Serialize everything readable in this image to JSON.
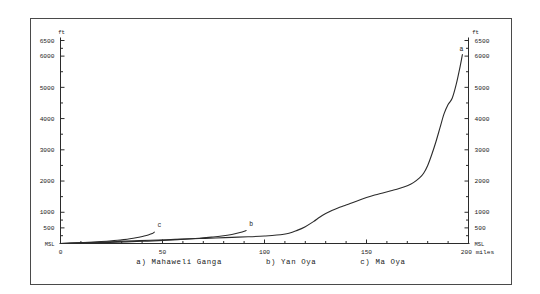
{
  "figure": {
    "y_unit_label": "ft",
    "x_unit_label": "miles",
    "baseline_label": "MSL"
  },
  "legend": {
    "entries": [
      {
        "key": "a",
        "label": "a) Mahaweli Ganga"
      },
      {
        "key": "b",
        "label": "b) Yan Oya"
      },
      {
        "key": "c",
        "label": "c) Ma Oya"
      }
    ]
  },
  "curve_labels": {
    "a": "a",
    "b": "b",
    "c": "c"
  },
  "axis_text": {
    "y_left": [
      "6500",
      "6000",
      "5000",
      "4000",
      "3000",
      "2000",
      "1000",
      "500",
      "MSL"
    ],
    "y_right": [
      "6500",
      "6000",
      "5000",
      "4000",
      "3000",
      "2000",
      "1000",
      "500",
      "MSL"
    ],
    "x": [
      "0",
      "50",
      "100",
      "150",
      "200"
    ],
    "x_end_unit": "200 miles",
    "y_top_unit_left": "ft",
    "y_top_unit_right": "ft"
  },
  "chart_data": {
    "type": "line",
    "title": "",
    "subtitle": "",
    "xlabel": "miles",
    "ylabel": "ft",
    "xlim": [
      0,
      200
    ],
    "ylim": [
      0,
      6500
    ],
    "grid": false,
    "legend_position": "below-plot",
    "annotations": [
      {
        "text": "a",
        "x": 197,
        "y": 6050
      },
      {
        "text": "b",
        "x": 92,
        "y": 430
      },
      {
        "text": "c",
        "x": 47,
        "y": 390
      }
    ],
    "y_ticks_major": [
      0,
      500,
      1000,
      2000,
      3000,
      4000,
      5000,
      6000,
      6500
    ],
    "y_tick_labels": [
      "MSL",
      "500",
      "1000",
      "2000",
      "3000",
      "4000",
      "5000",
      "6000",
      "6500"
    ],
    "y_ticks_minor": [
      250,
      750,
      1500,
      2500,
      3500,
      4500,
      5500,
      6250
    ],
    "x_ticks_major": [
      0,
      50,
      100,
      150,
      200
    ],
    "x_tick_labels": [
      "0",
      "50",
      "100",
      "150",
      "200"
    ],
    "x_ticks_minor": [
      10,
      20,
      30,
      40,
      60,
      70,
      80,
      90,
      110,
      120,
      130,
      140,
      160,
      170,
      180,
      190
    ],
    "series": [
      {
        "name": "a) Mahaweli Ganga",
        "key": "a",
        "color": "#2b2b2b",
        "x": [
          0,
          6,
          12,
          20,
          28,
          36,
          44,
          52,
          60,
          68,
          76,
          84,
          92,
          100,
          106,
          112,
          116,
          120,
          124,
          127,
          130,
          133,
          136,
          139,
          142,
          146,
          150,
          154,
          158,
          162,
          166,
          170,
          173,
          176,
          178,
          180,
          182,
          184,
          186,
          188,
          190,
          192,
          194,
          196,
          197
        ],
        "y": [
          0,
          15,
          30,
          48,
          66,
          85,
          104,
          122,
          140,
          158,
          176,
          196,
          215,
          240,
          270,
          330,
          420,
          540,
          700,
          840,
          960,
          1060,
          1140,
          1210,
          1280,
          1380,
          1470,
          1550,
          1620,
          1690,
          1760,
          1850,
          1950,
          2100,
          2250,
          2500,
          2850,
          3250,
          3700,
          4150,
          4450,
          4650,
          5100,
          5700,
          6050
        ]
      },
      {
        "name": "b) Yan Oya",
        "key": "b",
        "color": "#2b2b2b",
        "x": [
          0,
          8,
          16,
          24,
          32,
          40,
          48,
          55,
          62,
          68,
          74,
          79,
          84,
          88,
          91
        ],
        "y": [
          0,
          10,
          22,
          36,
          52,
          70,
          92,
          115,
          142,
          170,
          205,
          240,
          290,
          350,
          415
        ]
      },
      {
        "name": "c) Ma Oya",
        "key": "c",
        "color": "#2b2b2b",
        "x": [
          0,
          5,
          10,
          15,
          20,
          24,
          28,
          31,
          34,
          37,
          39,
          41,
          43,
          45,
          46
        ],
        "y": [
          0,
          12,
          26,
          42,
          62,
          80,
          102,
          124,
          150,
          182,
          210,
          240,
          275,
          320,
          365
        ]
      }
    ]
  }
}
